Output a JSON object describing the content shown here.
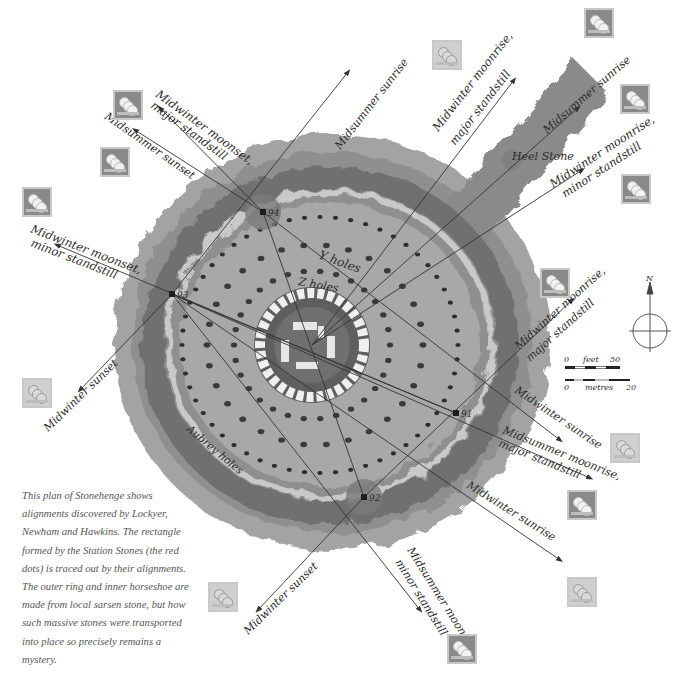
{
  "caption": {
    "text": "This plan of Stonehenge shows alignments discovered by Lockyer, Newham and Hawkins. The rectangle formed by the Station Stones (the red dots) is traced out by their alignments. The outer ring and inner horseshoe are made from local sarsen stone, but how such massive stones were transported into place so precisely remains a mystery."
  },
  "map": {
    "feature_labels": {
      "heel_stone": "Heel Stone",
      "y_holes": "Y holes",
      "z_holes": "Z holes",
      "aubrey_holes": "Aubrey holes"
    },
    "station_stones": [
      {
        "id": "91",
        "x": 456,
        "y": 413
      },
      {
        "id": "92",
        "x": 364,
        "y": 497
      },
      {
        "id": "93",
        "x": 172,
        "y": 294
      },
      {
        "id": "94",
        "x": 263,
        "y": 212
      }
    ],
    "alignments": [
      {
        "line1": "Midsummer sunrise",
        "line2": "",
        "direction": "NE (center)",
        "icon": "dark"
      },
      {
        "line1": "Midwinter moonrise,",
        "line2": "major standstill",
        "direction": "NE",
        "icon": "dark"
      },
      {
        "line1": "Midwinter moonrise,",
        "line2": "minor standstill",
        "direction": "ENE",
        "icon": "dark"
      },
      {
        "line1": "Midwinter moonrise,",
        "line2": "major standstill",
        "direction": "E (from 92)",
        "icon": "dark"
      },
      {
        "line1": "Midwinter sunrise",
        "line2": "",
        "direction": "SE (from 94)",
        "icon": "light"
      },
      {
        "line1": "Midsummer moonrise,",
        "line2": "major standstill",
        "direction": "SE (from 93)",
        "icon": "dark"
      },
      {
        "line1": "Midwinter sunrise",
        "line2": "",
        "direction": "SE (from 93)",
        "icon": "light"
      },
      {
        "line1": "Midsummer moonrise,",
        "line2": "minor standstill",
        "direction": "SSE",
        "icon": "dark"
      },
      {
        "line1": "Midwinter sunset",
        "line2": "",
        "direction": "SW (from 92)",
        "icon": "light"
      },
      {
        "line1": "Midwinter sunset",
        "line2": "",
        "direction": "SW (from 93)",
        "icon": "light"
      },
      {
        "line1": "Midwinter moonset,",
        "line2": "minor standstill",
        "direction": "W",
        "icon": "dark"
      },
      {
        "line1": "Midsummer sunset",
        "line2": "",
        "direction": "NW",
        "icon": "dark"
      },
      {
        "line1": "Midwinter moonset,",
        "line2": "major standstill",
        "direction": "NW",
        "icon": "dark"
      },
      {
        "line1": "Midsummer sunrise",
        "line2": "",
        "direction": "NE (from 93)",
        "icon": "light"
      }
    ],
    "compass": {
      "north_label": "N"
    },
    "scale": {
      "feet": {
        "start": "0",
        "unit": "feet",
        "end": "50"
      },
      "metres": {
        "start": "0",
        "unit": "metres",
        "end": "20"
      }
    }
  },
  "icons": [
    {
      "name": "moon-phase-icon",
      "x": 113,
      "y": 90,
      "variant": "dark"
    },
    {
      "name": "moon-phase-icon",
      "x": 100,
      "y": 147,
      "variant": "dark"
    },
    {
      "name": "moon-phase-icon",
      "x": 22,
      "y": 187,
      "variant": "dark"
    },
    {
      "name": "sun-phase-icon",
      "x": 432,
      "y": 40,
      "variant": "light"
    },
    {
      "name": "moon-phase-icon",
      "x": 584,
      "y": 8,
      "variant": "dark"
    },
    {
      "name": "moon-phase-icon",
      "x": 620,
      "y": 84,
      "variant": "dark"
    },
    {
      "name": "moon-phase-icon",
      "x": 621,
      "y": 174,
      "variant": "dark"
    },
    {
      "name": "moon-phase-icon",
      "x": 540,
      "y": 268,
      "variant": "dark"
    },
    {
      "name": "sun-phase-icon",
      "x": 22,
      "y": 378,
      "variant": "light"
    },
    {
      "name": "sun-phase-icon",
      "x": 610,
      "y": 433,
      "variant": "light"
    },
    {
      "name": "moon-phase-icon",
      "x": 567,
      "y": 490,
      "variant": "dark"
    },
    {
      "name": "sun-phase-icon",
      "x": 567,
      "y": 577,
      "variant": "light"
    },
    {
      "name": "sun-phase-icon",
      "x": 208,
      "y": 582,
      "variant": "light"
    },
    {
      "name": "moon-phase-icon",
      "x": 447,
      "y": 634,
      "variant": "dark"
    }
  ]
}
